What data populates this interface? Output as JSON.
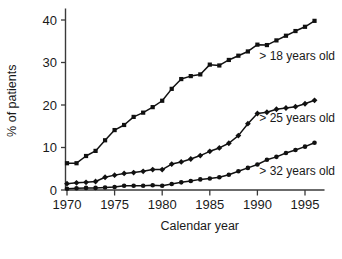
{
  "chart_data": {
    "type": "line",
    "title": "",
    "xlabel": "Calendar year",
    "ylabel": "% of patients",
    "xlim": [
      1969,
      1997
    ],
    "ylim": [
      0,
      42
    ],
    "xticks": [
      1970,
      1975,
      1980,
      1985,
      1990,
      1995
    ],
    "yticks": [
      0,
      10,
      20,
      30,
      40
    ],
    "xtick_labels": [
      "1970",
      "1975",
      "1980",
      "1985",
      "1990",
      "1995"
    ],
    "ytick_labels": [
      "0",
      "10",
      "20",
      "30",
      "40"
    ],
    "grid": false,
    "legend_position": "inline-right",
    "marker": "filled",
    "line_color": "#111111",
    "x": [
      1970,
      1971,
      1972,
      1973,
      1974,
      1975,
      1976,
      1977,
      1978,
      1979,
      1980,
      1981,
      1982,
      1983,
      1984,
      1985,
      1986,
      1987,
      1988,
      1989,
      1990,
      1991,
      1992,
      1993,
      1994,
      1995,
      1996
    ],
    "series": [
      {
        "name": "> 18 years old",
        "label": "> 18 years old",
        "marker": "square",
        "label_x": 1990.2,
        "label_y": 30.6,
        "values": [
          6.3,
          6.3,
          8.0,
          9.2,
          11.7,
          14.1,
          15.3,
          17.2,
          18.2,
          19.5,
          21.0,
          23.8,
          26.1,
          26.8,
          27.2,
          29.5,
          29.3,
          30.6,
          31.6,
          32.6,
          34.2,
          34.1,
          35.2,
          36.3,
          37.4,
          38.4,
          39.8
        ]
      },
      {
        "name": "> 25 years old",
        "label": "> 25 years old",
        "marker": "diamond",
        "label_x": 1990.2,
        "label_y": 16.1,
        "values": [
          1.5,
          1.7,
          1.8,
          2.0,
          3.0,
          3.5,
          3.9,
          4.1,
          4.4,
          4.8,
          4.8,
          6.1,
          6.6,
          7.3,
          8.1,
          9.1,
          9.9,
          11.0,
          12.8,
          15.6,
          18.0,
          18.3,
          19.0,
          19.3,
          19.6,
          20.3,
          21.1
        ]
      },
      {
        "name": "> 32 years old",
        "label": "> 32 years old",
        "marker": "circle",
        "label_x": 1990.2,
        "label_y": 3.6,
        "values": [
          0.3,
          0.4,
          0.5,
          0.5,
          0.6,
          0.7,
          1.0,
          1.0,
          1.0,
          1.1,
          1.0,
          1.4,
          1.8,
          2.1,
          2.5,
          2.7,
          3.0,
          3.6,
          4.4,
          5.2,
          6.0,
          7.1,
          7.8,
          8.7,
          9.4,
          10.2,
          11.1
        ]
      }
    ]
  },
  "axes": {
    "y_axis_label": "% of patients",
    "x_axis_label": "Calendar year"
  }
}
